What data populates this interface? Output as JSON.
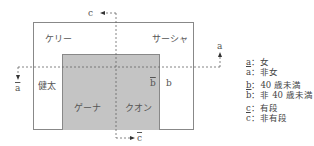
{
  "diagram": {
    "regions": {
      "kerry": "ケリー",
      "sasha": "サーシャ",
      "kenta": "健太",
      "gena": "ゲーナ",
      "kuon": "クオン"
    },
    "axis_labels": {
      "a": "a",
      "a_bar": "a",
      "b": "b",
      "b_bar": "b",
      "c": "c",
      "c_bar": "c"
    },
    "legend": [
      {
        "symbol": "a",
        "bar": false,
        "sep": "：",
        "text": "女"
      },
      {
        "symbol": "a",
        "bar": true,
        "sep": "：",
        "text": "非女"
      },
      {
        "symbol": "b",
        "bar": false,
        "sep": "：",
        "text": "40 歳未満"
      },
      {
        "symbol": "b",
        "bar": true,
        "sep": "：",
        "text": "非 40 歳未満"
      },
      {
        "symbol": "c",
        "bar": false,
        "sep": "：",
        "text": "有段"
      },
      {
        "symbol": "c",
        "bar": true,
        "sep": "：",
        "text": "非有段"
      }
    ],
    "colors": {
      "shaded": "#c4c4c4",
      "border": "#888888",
      "text": "#444444"
    }
  }
}
